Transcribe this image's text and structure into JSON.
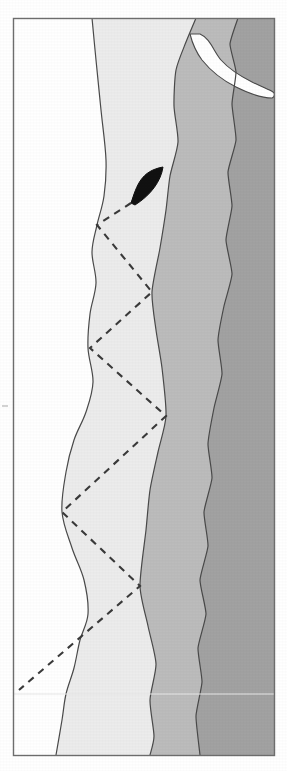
{
  "figure": {
    "type": "map",
    "title": "",
    "background_color": "#ffffff",
    "frame": {
      "name": "map-border",
      "x": 13,
      "y": 18,
      "width": 261,
      "height": 737,
      "stroke_color": "#6e6e6e",
      "stroke_width": 1.4
    },
    "tick_mark": {
      "label": "",
      "x": 2,
      "y": 406,
      "color": "#c9c9c9"
    },
    "scan_line": {
      "label": "",
      "y": 694,
      "color": "#e6e6e6"
    }
  },
  "legend_colors": {
    "zone_white": "#ffffff",
    "zone_pale": "#ececec",
    "zone_light_gray": "#bcbcbc",
    "zone_dark_gray": "#a2a2a2",
    "outline": "#4a4a4a",
    "marker_black": "#111111",
    "dashed_line": "#3a3a3a"
  },
  "zones": [
    {
      "name": "zone-white-land",
      "label": "Zone 1",
      "fill": "#ffffff",
      "description": "westernmost unshaded band"
    },
    {
      "name": "zone-pale",
      "label": "Zone 2",
      "fill": "#ececec",
      "description": "pale shaded band"
    },
    {
      "name": "zone-light-gray",
      "label": "Zone 3",
      "fill": "#bcbcbc",
      "description": "medium gray band"
    },
    {
      "name": "zone-dark-gray",
      "label": "Zone 4",
      "fill": "#a2a2a2",
      "description": "easternmost dark gray band"
    }
  ],
  "features": {
    "spit": {
      "name": "white-spit-inlet",
      "label": "",
      "fill": "#ffffff",
      "location": "upper right"
    },
    "marker": {
      "name": "black-arrowhead-marker",
      "label": "",
      "fill": "#111111",
      "tip_x": 163,
      "tip_y": 167,
      "tail_x": 131,
      "tail_y": 203
    }
  },
  "chart_data": {
    "type": "line",
    "title": "",
    "xlabel": "",
    "ylabel": "",
    "grid": false,
    "legend": "none",
    "annotations": [
      "black arrowhead marker at transect origin",
      "white spit / inlet in upper right"
    ],
    "series": [
      {
        "name": "dashed-transect-path",
        "style": "dashed",
        "color": "#3a3a3a",
        "points": [
          [
            131,
            203
          ],
          [
            97,
            225
          ],
          [
            152,
            292
          ],
          [
            90,
            348
          ],
          [
            166,
            416
          ],
          [
            62,
            512
          ],
          [
            140,
            586
          ],
          [
            19,
            690
          ]
        ]
      },
      {
        "name": "boundary-white-to-pale",
        "style": "solid",
        "color": "#4a4a4a",
        "points": [
          [
            92,
            18
          ],
          [
            96,
            60
          ],
          [
            101,
            110
          ],
          [
            106,
            160
          ],
          [
            104,
            196
          ],
          [
            97,
            225
          ],
          [
            92,
            252
          ],
          [
            96,
            283
          ],
          [
            90,
            314
          ],
          [
            88,
            348
          ],
          [
            93,
            382
          ],
          [
            86,
            412
          ],
          [
            74,
            440
          ],
          [
            66,
            472
          ],
          [
            62,
            512
          ],
          [
            72,
            548
          ],
          [
            84,
            580
          ],
          [
            88,
            614
          ],
          [
            80,
            640
          ],
          [
            74,
            668
          ],
          [
            66,
            694
          ],
          [
            62,
            720
          ],
          [
            56,
            755
          ]
        ]
      },
      {
        "name": "boundary-pale-to-light-gray",
        "style": "solid",
        "color": "#4a4a4a",
        "points": [
          [
            196,
            18
          ],
          [
            186,
            42
          ],
          [
            176,
            70
          ],
          [
            174,
            106
          ],
          [
            178,
            142
          ],
          [
            170,
            176
          ],
          [
            166,
            210
          ],
          [
            160,
            248
          ],
          [
            152,
            292
          ],
          [
            156,
            330
          ],
          [
            162,
            368
          ],
          [
            166,
            416
          ],
          [
            158,
            452
          ],
          [
            150,
            490
          ],
          [
            146,
            530
          ],
          [
            140,
            586
          ],
          [
            148,
            626
          ],
          [
            156,
            664
          ],
          [
            150,
            700
          ],
          [
            154,
            736
          ],
          [
            150,
            755
          ]
        ]
      },
      {
        "name": "boundary-light-to-dark-gray",
        "style": "solid",
        "color": "#4a4a4a",
        "points": [
          [
            238,
            18
          ],
          [
            230,
            44
          ],
          [
            236,
            72
          ],
          [
            232,
            104
          ],
          [
            236,
            140
          ],
          [
            228,
            172
          ],
          [
            232,
            206
          ],
          [
            226,
            240
          ],
          [
            232,
            274
          ],
          [
            224,
            306
          ],
          [
            218,
            340
          ],
          [
            222,
            374
          ],
          [
            214,
            408
          ],
          [
            208,
            444
          ],
          [
            212,
            478
          ],
          [
            204,
            512
          ],
          [
            208,
            546
          ],
          [
            200,
            580
          ],
          [
            206,
            614
          ],
          [
            198,
            648
          ],
          [
            202,
            682
          ],
          [
            196,
            716
          ],
          [
            200,
            755
          ]
        ]
      }
    ]
  }
}
